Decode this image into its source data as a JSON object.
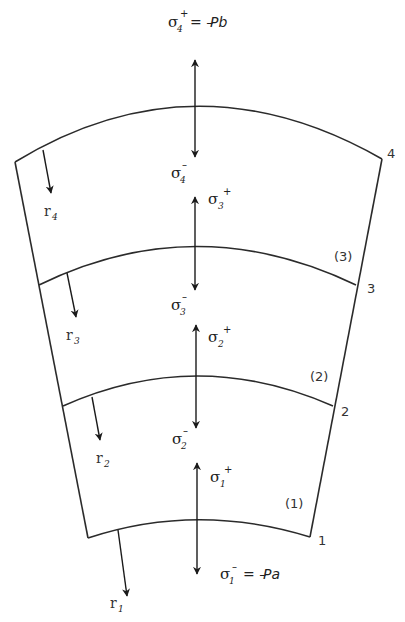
{
  "diagram": {
    "title": "",
    "stress_labels": {
      "s4_plus": {
        "sym": "σ",
        "sub": "4",
        "sup": "+"
      },
      "s4_plus_eq": "= –",
      "s4_plus_rhs": "Pb",
      "s4_minus": {
        "sym": "σ",
        "sub": "4",
        "sup": "–"
      },
      "s3_plus": {
        "sym": "σ",
        "sub": "3",
        "sup": "+"
      },
      "s3_minus": {
        "sym": "σ",
        "sub": "3",
        "sup": "–"
      },
      "s2_plus": {
        "sym": "σ",
        "sub": "2",
        "sup": "+"
      },
      "s2_minus": {
        "sym": "σ",
        "sub": "2",
        "sup": "–"
      },
      "s1_plus": {
        "sym": "σ",
        "sub": "1",
        "sup": "+"
      },
      "s1_minus": {
        "sym": "σ",
        "sub": "1",
        "sup": "–"
      },
      "s1_minus_eq": "= –",
      "s1_minus_rhs": "Pa"
    },
    "radius_labels": [
      {
        "sym": "r",
        "sub": "4"
      },
      {
        "sym": "r",
        "sub": "3"
      },
      {
        "sym": "r",
        "sub": "2"
      },
      {
        "sym": "r",
        "sub": "1"
      }
    ],
    "interface_numbers": [
      "1",
      "2",
      "3",
      "4"
    ],
    "layer_labels": [
      "(1)",
      "(2)",
      "(3)"
    ],
    "colors": {
      "stroke": "#2b2b2b",
      "text": "#333333",
      "background": "#ffffff"
    }
  }
}
